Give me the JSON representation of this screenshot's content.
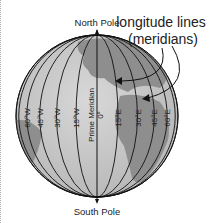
{
  "title": "longitude lines",
  "subtitle": "(meridians)",
  "north_pole": "North Pole",
  "south_pole": "South Pole",
  "prime_meridian": "Prime Meridian",
  "prime_degree": "0°",
  "meridians_west": [
    "60°W",
    "45°W",
    "30°W",
    "15°W"
  ],
  "meridians_east": [
    "15°E",
    "30°E",
    "45°E",
    "60°E"
  ],
  "colors": {
    "ocean": "#c8c8c8",
    "land": "#8f8f8f",
    "line": "#111111"
  }
}
